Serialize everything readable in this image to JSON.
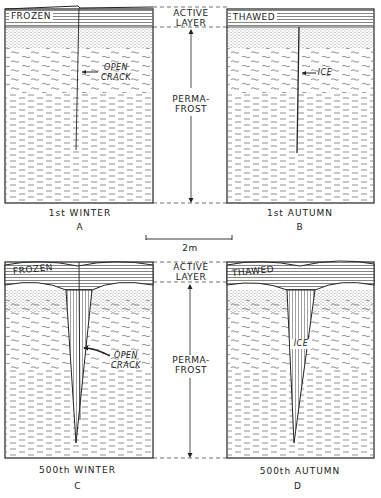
{
  "figure": {
    "scale_bar": "2m",
    "zone_labels": {
      "active_layer_line1": "ACTIVE",
      "active_layer_line2": "LAYER",
      "permafrost_line1": "PERMA-",
      "permafrost_line2": "FROST"
    },
    "panels": [
      {
        "id": "A",
        "caption": "1st  WINTER",
        "letter": "A",
        "surface_label": "FROZEN",
        "callout_line1": "OPEN",
        "callout_line2": "CRACK"
      },
      {
        "id": "B",
        "caption": "1st  AUTUMN",
        "letter": "B",
        "surface_label": "THAWED",
        "callout_line1": "ICE",
        "callout_line2": ""
      },
      {
        "id": "C",
        "caption": "500th  WINTER",
        "letter": "C",
        "surface_label": "FROZEN",
        "callout_line1": "OPEN",
        "callout_line2": "CRACK"
      },
      {
        "id": "D",
        "caption": "500th  AUTUMN",
        "letter": "D",
        "surface_label": "THAWED",
        "callout_line1": "ICE",
        "callout_line2": ""
      }
    ],
    "colors": {
      "ink": "#222222",
      "background": "#ffffff"
    }
  }
}
